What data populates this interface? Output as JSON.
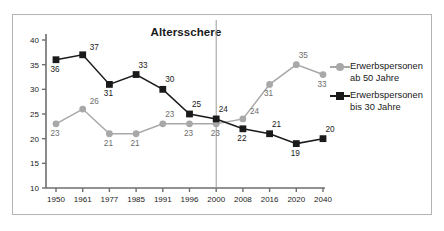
{
  "top_strip_text": "",
  "chart_title": "Altersschere",
  "legend": {
    "position": "right",
    "entries": [
      {
        "label_line1": "Erwerbspersonen",
        "label_line2": "ab 50 Jahre",
        "marker": "circle",
        "color": "#a8a8a8"
      },
      {
        "label_line1": "Erwerbspersonen",
        "label_line2": "bis 30 Jahre",
        "marker": "square",
        "color": "#1a1a1a"
      }
    ]
  },
  "chart_data": {
    "type": "line",
    "title": "Altersschere",
    "xlabel": "",
    "ylabel": "",
    "ylim": [
      10,
      40
    ],
    "yticks": [
      10,
      15,
      20,
      25,
      30,
      35,
      40
    ],
    "grid": false,
    "legend_position": "right",
    "categories": [
      "1950",
      "1961",
      "1977",
      "1985",
      "1991",
      "1996",
      "2000",
      "2008",
      "2016",
      "2020",
      "2040"
    ],
    "annotations": [
      {
        "type": "vertical-line",
        "at": "2000",
        "note": "separates history from projection"
      }
    ],
    "series": [
      {
        "name": "Erwerbspersonen ab 50 Jahre",
        "color": "#a8a8a8",
        "marker": "circle",
        "values": [
          23,
          26,
          21,
          21,
          23,
          23,
          23,
          24,
          31,
          35,
          33
        ],
        "label_positions": [
          "below",
          "right",
          "below",
          "below",
          "above",
          "below",
          "below",
          "right",
          "below",
          "above",
          "below"
        ]
      },
      {
        "name": "Erwerbspersonen bis 30 Jahre",
        "color": "#1a1a1a",
        "marker": "square",
        "values": [
          36,
          37,
          31,
          33,
          30,
          25,
          24,
          22,
          21,
          19,
          20
        ],
        "label_positions": [
          "below",
          "right",
          "below",
          "above",
          "above",
          "above",
          "above",
          "below",
          "above",
          "below",
          "above"
        ]
      }
    ]
  }
}
